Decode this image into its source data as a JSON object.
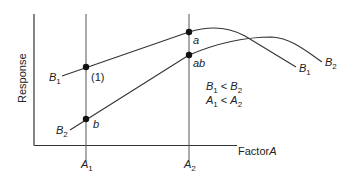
{
  "diagram": {
    "y_axis_label": "Response",
    "x_axis_label_prefix": "Factor",
    "x_axis_label_var": "A",
    "levels": {
      "a1": {
        "base": "A",
        "sub": "1"
      },
      "a2": {
        "base": "A",
        "sub": "2"
      }
    },
    "curves": {
      "b1_left": {
        "base": "B",
        "sub": "1"
      },
      "b2_left": {
        "base": "B",
        "sub": "2"
      },
      "b1_right": {
        "base": "B",
        "sub": "1"
      },
      "b2_right": {
        "base": "B",
        "sub": "2"
      }
    },
    "points": {
      "p1": "(1)",
      "a": "a",
      "ab": "ab",
      "b": "b"
    },
    "conditions": [
      {
        "l_base": "B",
        "l_sub": "1",
        "op": " < ",
        "r_base": "B",
        "r_sub": "2"
      },
      {
        "l_base": "A",
        "l_sub": "1",
        "op": " < ",
        "r_base": "A",
        "r_sub": "2"
      }
    ],
    "colors": {
      "line": "#333333",
      "point": "#111111"
    }
  }
}
